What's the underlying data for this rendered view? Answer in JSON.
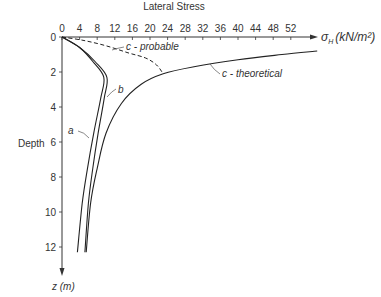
{
  "chart_data": {
    "type": "line",
    "title": "Lateral Stress",
    "xlabel": "σH (kN/m²)",
    "ylabel": "Depth",
    "y_axis_unit_label": "z (m)",
    "x_ticks": [
      0,
      4,
      8,
      12,
      16,
      20,
      24,
      28,
      32,
      36,
      40,
      44,
      48,
      52
    ],
    "y_ticks": [
      0,
      2,
      4,
      6,
      8,
      10,
      12
    ],
    "xlim": [
      0,
      56
    ],
    "ylim": [
      12.4,
      0
    ],
    "grid": false,
    "legend_position": "inline annotations",
    "series": [
      {
        "name": "a",
        "style": "solid",
        "points": [
          [
            0,
            0
          ],
          [
            4,
            0.6
          ],
          [
            7,
            1.4
          ],
          [
            9.5,
            2.3
          ],
          [
            8.8,
            3.5
          ],
          [
            7.2,
            5.5
          ],
          [
            5.8,
            7.5
          ],
          [
            4.6,
            9.5
          ],
          [
            3.5,
            12.3
          ]
        ]
      },
      {
        "name": "b",
        "style": "solid",
        "points": [
          [
            0,
            0
          ],
          [
            4,
            0.6
          ],
          [
            7.5,
            1.4
          ],
          [
            10.2,
            2.3
          ],
          [
            9.6,
            3.5
          ],
          [
            8.2,
            5.5
          ],
          [
            7,
            7.5
          ],
          [
            6,
            9.5
          ],
          [
            5.2,
            12.3
          ]
        ]
      },
      {
        "name": "c - theoretical",
        "style": "solid",
        "points": [
          [
            5.5,
            12.3
          ],
          [
            6.5,
            9.5
          ],
          [
            8,
            7.5
          ],
          [
            10,
            5.5
          ],
          [
            13.5,
            3.8
          ],
          [
            18,
            2.7
          ],
          [
            23,
            2.1
          ],
          [
            30,
            1.7
          ],
          [
            40,
            1.3
          ],
          [
            50,
            1.0
          ],
          [
            58,
            0.8
          ]
        ]
      },
      {
        "name": "c - probable",
        "style": "dashed",
        "points": [
          [
            0,
            0
          ],
          [
            5,
            0.2
          ],
          [
            10,
            0.5
          ],
          [
            15,
            0.9
          ],
          [
            19,
            1.2
          ],
          [
            21.5,
            1.6
          ],
          [
            23,
            2.1
          ]
        ]
      }
    ],
    "annotations": [
      "a",
      "b",
      "c - probable",
      "c - theoretical"
    ]
  },
  "labels": {
    "title": "Lateral Stress",
    "x_axis_symbol": "σ",
    "x_axis_sub": "H",
    "x_axis_unit": "(kN/m²)",
    "y_axis_label": "Depth",
    "y_axis_unit": "z (m)",
    "curve_a": "a",
    "curve_b": "b",
    "curve_c_probable": "c - probable",
    "curve_c_theoretical": "c - theoretical"
  }
}
